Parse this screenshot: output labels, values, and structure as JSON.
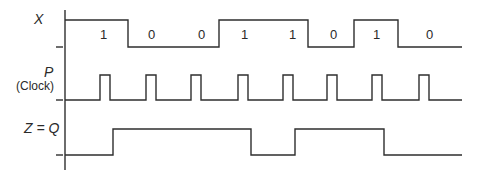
{
  "diagram": {
    "type": "timing-diagram",
    "colors": {
      "line": "#2e2e2e",
      "text": "#2a2a2a",
      "background": "#ffffff"
    },
    "signals": [
      {
        "name": "X",
        "label": "X",
        "sublabel": "",
        "bits": [
          "1",
          "0",
          "0",
          "1",
          "1",
          "0",
          "1",
          "0"
        ]
      },
      {
        "name": "P",
        "label": "P",
        "sublabel": "(Clock)",
        "pulse_count": 8
      },
      {
        "name": "Z",
        "label": "Z = Q",
        "sublabel": ""
      }
    ]
  }
}
